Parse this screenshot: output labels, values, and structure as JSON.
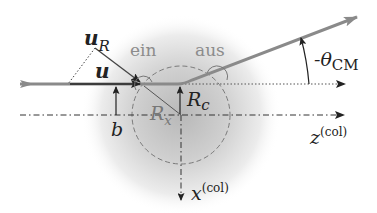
{
  "diagram": {
    "labels": {
      "u_R_main": "u",
      "u_R_sub": "R",
      "u": "u",
      "ein": "ein",
      "aus": "aus",
      "theta_prefix": "-θ",
      "theta_sub": "CM",
      "b": "b",
      "R_x_main": "R",
      "R_x_sub": "x",
      "R_c_main": "R",
      "R_c_sub": "c",
      "z_main": "z",
      "z_sup": "(col)",
      "x_main": "x",
      "x_sup": "(col)"
    },
    "colors": {
      "trajectory": "#8a8a8a",
      "line_dark": "#222222",
      "dashed": "#777777",
      "label_gray": "#8c8c8c",
      "potential_center": "#bdbdbd"
    }
  }
}
